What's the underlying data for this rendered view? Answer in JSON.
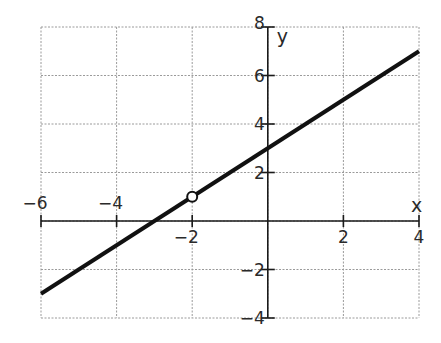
{
  "chart_data": {
    "type": "line",
    "title": "",
    "xlabel": "x",
    "ylabel": "y",
    "xlim": [
      -6,
      4
    ],
    "ylim": [
      -4,
      8
    ],
    "grid": true,
    "grid_style": "dashed",
    "x_grid_step": 2,
    "y_grid_step": 2,
    "x_ticks": [
      -6,
      -4,
      -2,
      0,
      2,
      4
    ],
    "x_tick_labels": [
      "−6",
      "−4",
      "−2",
      "2",
      "4"
    ],
    "x_tick_label_values": [
      -6,
      -4,
      -2,
      2,
      4
    ],
    "y_ticks": [
      -4,
      -2,
      0,
      2,
      4,
      6,
      8
    ],
    "y_tick_labels": [
      "−4",
      "−2",
      "2",
      "4",
      "6",
      "8"
    ],
    "y_tick_label_values": [
      -4,
      -2,
      2,
      4,
      6,
      8
    ],
    "series": [
      {
        "name": "y = x + 3",
        "x": [
          -6,
          4
        ],
        "y": [
          -3,
          7
        ],
        "color": "#111111"
      }
    ],
    "annotations": [
      {
        "type": "open-circle",
        "x": -2,
        "y": 1
      }
    ]
  }
}
